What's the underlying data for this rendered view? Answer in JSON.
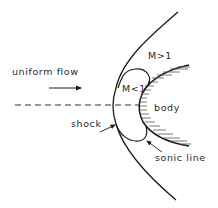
{
  "diagram": {
    "type": "bow shock around blunt body in supersonic flow",
    "labels": {
      "flow": "uniform flow",
      "supersonic_region": "M>1",
      "subsonic_region": "M<1",
      "body": "body",
      "shock": "shock",
      "sonic_line": "sonic line"
    },
    "elements": [
      {
        "name": "bow-shock",
        "kind": "curve",
        "from": [
          178,
          12
        ],
        "vertex": [
          114,
          105
        ],
        "to": [
          176,
          200
        ]
      },
      {
        "name": "body-surface",
        "kind": "curve",
        "from": [
          189,
          65
        ],
        "nose": [
          139,
          105
        ],
        "to": [
          189,
          146
        ],
        "hatched": true
      },
      {
        "name": "sonic-line",
        "kind": "closed-bubble",
        "bounds": {
          "top": 70,
          "bottom": 141,
          "left": 114,
          "right": 149
        }
      },
      {
        "name": "centerline",
        "kind": "dashed-line",
        "y": 105,
        "x_from": 15,
        "x_to": 140
      },
      {
        "name": "flow-arrow",
        "kind": "arrow",
        "from": [
          49,
          88
        ],
        "to": [
          82,
          88
        ]
      }
    ],
    "colors": {
      "line": "#1a1a1a",
      "background": "#ffffff"
    }
  }
}
